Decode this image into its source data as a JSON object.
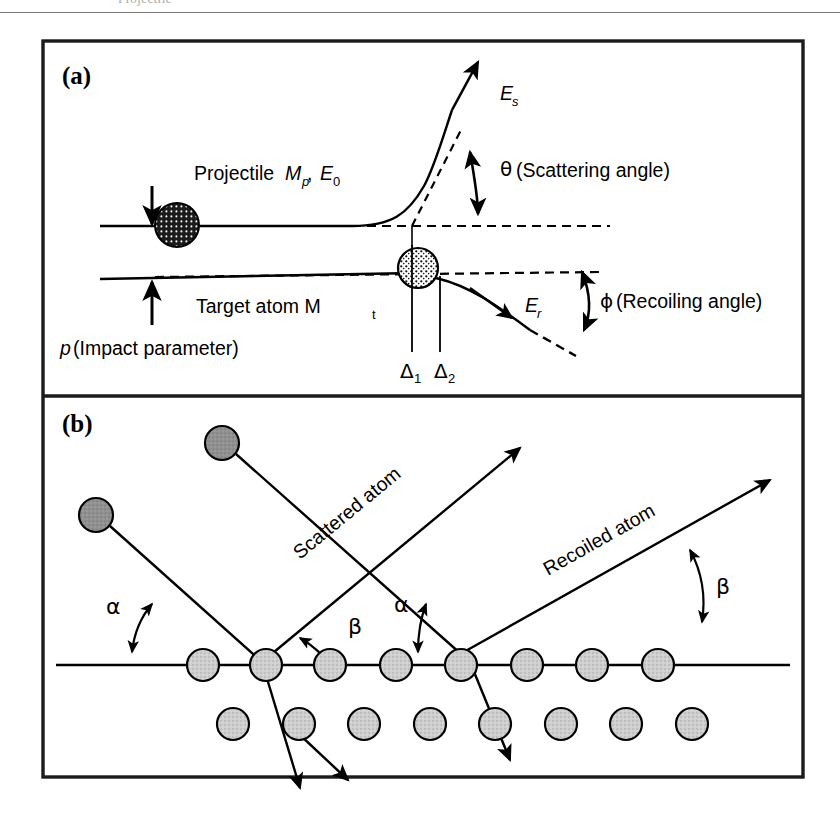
{
  "figure": {
    "title_cropped_top": "physics figure caption line (cropped)",
    "background_color": "#ffffff",
    "ink_color": "#000000",
    "panels": [
      {
        "tag": "(a)",
        "name": "binary-collision-kinematics",
        "labels": {
          "projectile": "Projectile",
          "projectile_symbol_mass": "M",
          "projectile_symbol_mass_sub": "p",
          "projectile_symbol_energy": "E",
          "projectile_symbol_energy_sub": "0",
          "projectile_full": "Projectile Mp, E0",
          "target": "Target atom M",
          "target_sub": "t",
          "target_full": "Target atom Mt",
          "impact_parameter": "p (Impact parameter)",
          "impact_parameter_symbol": "p",
          "scattered_energy": "E",
          "scattered_energy_sub": "s",
          "recoil_energy": "E",
          "recoil_energy_sub": "r",
          "scattering_angle": "(Scattering angle)",
          "scattering_angle_symbol": "θ",
          "recoiling_angle": "(Recoiling angle)",
          "recoiling_angle_symbol": "ϕ",
          "delta1": "Δ",
          "delta1_sub": "1",
          "delta2": "Δ",
          "delta2_sub": "2"
        }
      },
      {
        "tag": "(b)",
        "name": "surface-scattering-recoiling",
        "labels": {
          "scattered_atom": "Scattered atom",
          "recoiled_atom": "Recoiled atom",
          "alpha_symbol": "α",
          "beta_symbol": "β",
          "alpha_left": "α",
          "alpha_right": "α",
          "beta_left": "β",
          "beta_right": "β"
        },
        "lattice": {
          "surface_row_atom_count": 8,
          "second_row_atom_count": 8,
          "atom_fill": "#c9c9c9",
          "atom_stroke": "#000000"
        },
        "incoming_atom_fill": "#8f8f8f"
      }
    ]
  }
}
